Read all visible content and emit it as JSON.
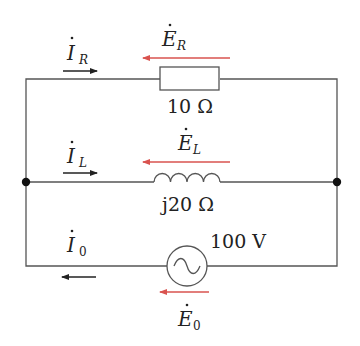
{
  "diagram": {
    "type": "circuit",
    "wire_color": "#555555",
    "arrow_black": "#222222",
    "arrow_red": "#d9534f",
    "branches": {
      "resistor": {
        "current": {
          "symbol": "I",
          "sub": "R",
          "direction": "right"
        },
        "emf": {
          "symbol": "E",
          "sub": "R",
          "direction": "left"
        },
        "value": "10 Ω"
      },
      "inductor": {
        "current": {
          "symbol": "I",
          "sub": "L",
          "direction": "right"
        },
        "emf": {
          "symbol": "E",
          "sub": "L",
          "direction": "left"
        },
        "value": "j20 Ω"
      },
      "source": {
        "current": {
          "symbol": "I",
          "sub": "0",
          "direction": "left"
        },
        "emf": {
          "symbol": "E",
          "sub": "0",
          "direction": "left"
        },
        "value": "100 V"
      }
    }
  }
}
